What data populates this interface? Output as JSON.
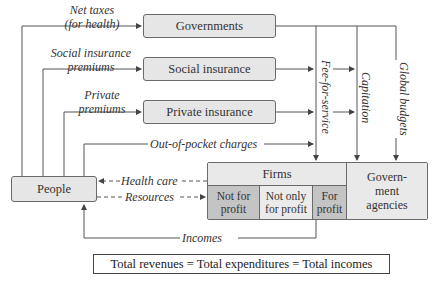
{
  "boxes": {
    "governments": "Governments",
    "social_insurance": "Social insurance",
    "private_insurance": "Private insurance",
    "people": "People"
  },
  "flows": {
    "net_taxes_line1": "Net taxes",
    "net_taxes_line2": "(for health)",
    "social_premiums_line1": "Social insurance",
    "social_premiums_line2": "premiums",
    "private_premiums_line1": "Private",
    "private_premiums_line2": "premiums",
    "out_of_pocket": "Out-of-pocket charges",
    "health_care": "Health care",
    "resources": "Resources",
    "incomes": "Incomes"
  },
  "payment_methods": {
    "fee_for_service": "Fee-for-service",
    "capitation": "Capitation",
    "global_budgets": "Global budgets"
  },
  "providers": {
    "firms_header": "Firms",
    "not_for_profit_line1": "Not for",
    "not_for_profit_line2": "profit",
    "not_only_line1": "Not only",
    "not_only_line2": "for profit",
    "for_profit_line1": "For",
    "for_profit_line2": "profit",
    "gov_agencies_line1": "Govern-",
    "gov_agencies_line2": "ment",
    "gov_agencies_line3": "agencies"
  },
  "identity": "Total revenues = Total expenditures = Total incomes",
  "colors": {
    "box_fill": "#e6e6e6",
    "dark_cell": "#c4c4c4",
    "light_cell": "#ebebeb",
    "line": "#555555"
  }
}
